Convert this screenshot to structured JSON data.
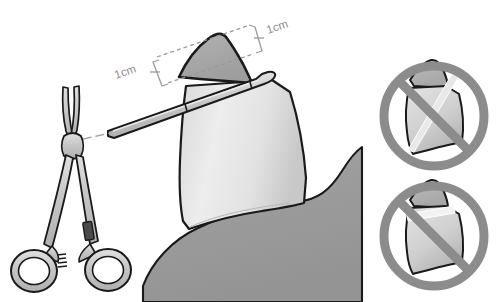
{
  "figure": {
    "background_color": "#ffffff"
  },
  "annotations": {
    "dimension_top_right": "1cm",
    "dimension_left": "1cm"
  },
  "palette": {
    "outline": "#1a1a1a",
    "body_fill": "#9a9a9a",
    "flap_fill": "#a8a8a8",
    "shaft_light": "#e9e9e9",
    "shaft_mid": "#d2d2d2",
    "instrument_fill": "#c9c9c9",
    "instrument_dark": "#4a4a4a",
    "prohibition_ring": "#8c8c8c",
    "guide_line": "#9a9a9a",
    "label_text": "#8d8d8d"
  },
  "main_illustration": {
    "name": "correct-technique-diagram",
    "description": "Clamp applied across the foreskin with 1cm margins marked",
    "elements": {
      "forceps": "surgical-hemostat-forceps",
      "clamp": "straight-crushing-clamp",
      "tissue": "penile-shaft-and-foreskin",
      "leader": "forceps-to-clamp-leader-line"
    }
  },
  "prohibited_examples": [
    {
      "name": "prohibited-example-1",
      "label": "Incorrect clamp angle - oblique placement",
      "index": 1
    },
    {
      "name": "prohibited-example-2",
      "label": "Incorrect clamp angle - too proximal placement",
      "index": 2
    }
  ]
}
